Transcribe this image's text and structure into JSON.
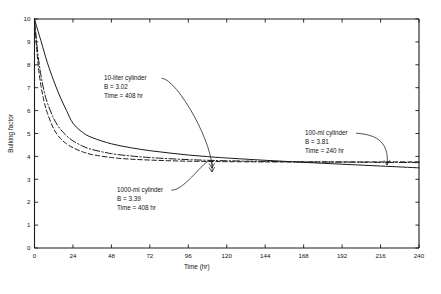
{
  "chart_data": {
    "type": "line",
    "title": "",
    "xlabel": "Time (hr)",
    "ylabel": "Bulking factor",
    "xlim": [
      0,
      240
    ],
    "ylim": [
      0,
      10
    ],
    "grid": false,
    "legend_position": "inline-annotations",
    "xticks": [
      0,
      24,
      48,
      72,
      96,
      120,
      144,
      168,
      192,
      216,
      240
    ],
    "yticks": [
      0,
      1,
      2,
      3,
      4,
      5,
      6,
      7,
      8,
      9,
      10
    ],
    "xtick_labels": [
      "0",
      "24",
      "48",
      "72",
      "96",
      "120",
      "144",
      "168",
      "192",
      "216",
      "240"
    ],
    "ytick_labels": [
      "0",
      "1",
      "2",
      "3",
      "4",
      "5",
      "6",
      "7",
      "8",
      "9",
      "10"
    ],
    "series": [
      {
        "name": "10-liter cylinder",
        "style": "solid",
        "B": 3.02,
        "time_hr": 408,
        "x": [
          0,
          4,
          8,
          12,
          16,
          20,
          24,
          30,
          36,
          48,
          60,
          72,
          84,
          96,
          108,
          120,
          144,
          168,
          192,
          216,
          240
        ],
        "y": [
          10.0,
          9.05,
          8.1,
          7.3,
          6.6,
          6.0,
          5.45,
          5.05,
          4.82,
          4.55,
          4.38,
          4.25,
          4.15,
          4.06,
          3.99,
          3.93,
          3.83,
          3.74,
          3.66,
          3.58,
          3.5
        ]
      },
      {
        "name": "1000-ml cylinder",
        "style": "dash-dot",
        "B": 3.39,
        "time_hr": 408,
        "x": [
          0,
          2,
          4,
          6,
          8,
          12,
          16,
          20,
          24,
          30,
          36,
          48,
          60,
          72,
          84,
          96,
          108,
          120,
          144,
          168,
          192,
          216,
          240
        ],
        "y": [
          10.0,
          8.55,
          7.55,
          6.85,
          6.35,
          5.65,
          5.2,
          4.9,
          4.68,
          4.45,
          4.3,
          4.12,
          4.02,
          3.95,
          3.9,
          3.86,
          3.83,
          3.81,
          3.78,
          3.76,
          3.75,
          3.74,
          3.73
        ]
      },
      {
        "name": "100-ml cylinder",
        "style": "dashed",
        "B": 3.81,
        "time_hr": 240,
        "x": [
          0,
          2,
          4,
          6,
          8,
          12,
          16,
          20,
          24,
          30,
          36,
          48,
          60,
          72,
          84,
          96,
          108,
          120,
          144,
          168,
          192,
          216,
          240
        ],
        "y": [
          10.0,
          8.2,
          7.1,
          6.4,
          5.9,
          5.2,
          4.8,
          4.55,
          4.38,
          4.2,
          4.08,
          3.95,
          3.88,
          3.84,
          3.81,
          3.79,
          3.78,
          3.77,
          3.76,
          3.76,
          3.76,
          3.76,
          3.76
        ]
      }
    ],
    "annotations": [
      {
        "id": "ann-10-liter",
        "lines": [
          "10-liter cylinder",
          "B = 3.02",
          "Time = 408 hr"
        ],
        "label_x": 104,
        "label_y": 80,
        "target_x": 212,
        "target_y": 172
      },
      {
        "id": "ann-1000-ml",
        "lines": [
          "1000-ml cylinder",
          "B = 3.39",
          "Time = 408 hr"
        ],
        "label_x": 117,
        "label_y": 192,
        "target_x": 212,
        "target_y": 168
      },
      {
        "id": "ann-100-ml",
        "lines": [
          "100-ml cylinder",
          "B = 3.81",
          "Time = 240 hr"
        ],
        "label_x": 305,
        "label_y": 135,
        "target_x": 387,
        "target_y": 165
      }
    ]
  },
  "figure": {
    "caption": ""
  }
}
